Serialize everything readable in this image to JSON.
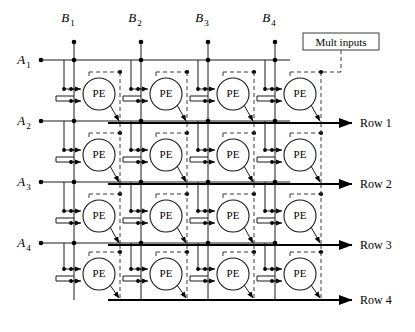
{
  "diagram": {
    "type": "systolic-array",
    "grid": {
      "rows": 4,
      "cols": 4
    },
    "pe_label": "PE",
    "colors": {
      "line": "#1a1a1a",
      "thick_line": "#000000",
      "dashed_line": "#3a3a3a",
      "background": "#ffffff"
    },
    "column_inputs": [
      {
        "label": "B",
        "subscript": "1",
        "x": 74
      },
      {
        "label": "B",
        "subscript": "2",
        "x": 141
      },
      {
        "label": "B",
        "subscript": "3",
        "x": 208
      },
      {
        "label": "B",
        "subscript": "4",
        "x": 275
      }
    ],
    "row_inputs": [
      {
        "label": "A",
        "subscript": "1",
        "y": 60
      },
      {
        "label": "A",
        "subscript": "2",
        "y": 121
      },
      {
        "label": "A",
        "subscript": "3",
        "y": 182
      },
      {
        "label": "A",
        "subscript": "4",
        "y": 243
      }
    ],
    "row_outputs": [
      {
        "label": "Row 1",
        "y": 123
      },
      {
        "label": "Row 2",
        "y": 184
      },
      {
        "label": "Row 3",
        "y": 245
      },
      {
        "label": "Row 4",
        "y": 300
      }
    ],
    "mult_inputs_box": {
      "label": "Mult  inputs",
      "x": 303,
      "y": 33,
      "width": 76,
      "height": 17
    },
    "pe_cells": [
      {
        "row": 1,
        "col": 1,
        "cx": 99,
        "cy": 94
      },
      {
        "row": 1,
        "col": 2,
        "cx": 166,
        "cy": 94
      },
      {
        "row": 1,
        "col": 3,
        "cx": 233,
        "cy": 94
      },
      {
        "row": 1,
        "col": 4,
        "cx": 300,
        "cy": 94
      },
      {
        "row": 2,
        "col": 1,
        "cx": 99,
        "cy": 155
      },
      {
        "row": 2,
        "col": 2,
        "cx": 166,
        "cy": 155
      },
      {
        "row": 2,
        "col": 3,
        "cx": 233,
        "cy": 155
      },
      {
        "row": 2,
        "col": 4,
        "cx": 300,
        "cy": 155
      },
      {
        "row": 3,
        "col": 1,
        "cx": 99,
        "cy": 216
      },
      {
        "row": 3,
        "col": 2,
        "cx": 166,
        "cy": 216
      },
      {
        "row": 3,
        "col": 3,
        "cx": 233,
        "cy": 216
      },
      {
        "row": 3,
        "col": 4,
        "cx": 300,
        "cy": 216
      },
      {
        "row": 4,
        "col": 1,
        "cx": 99,
        "cy": 274
      },
      {
        "row": 4,
        "col": 2,
        "cx": 166,
        "cy": 274
      },
      {
        "row": 4,
        "col": 3,
        "cx": 233,
        "cy": 274
      },
      {
        "row": 4,
        "col": 4,
        "cx": 300,
        "cy": 274
      }
    ]
  }
}
